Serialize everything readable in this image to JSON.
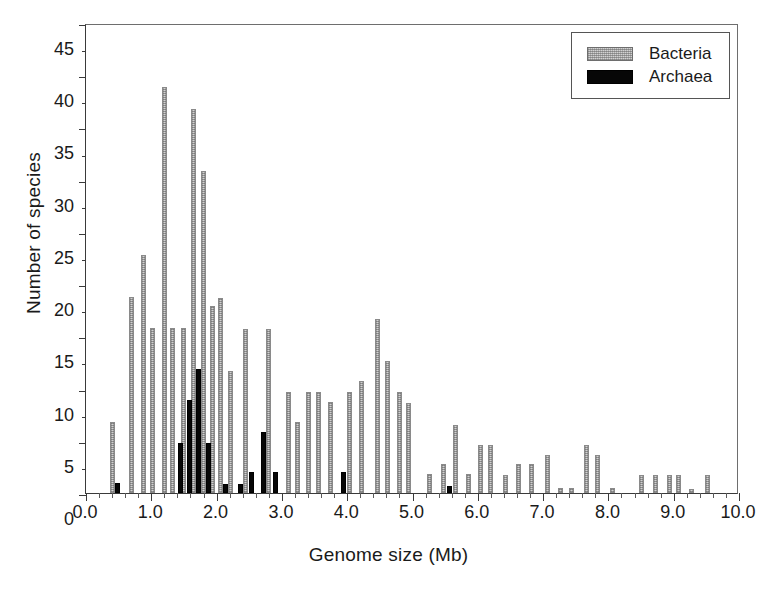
{
  "figure": {
    "background": "#ffffff",
    "caption_fragment": ""
  },
  "legend": {
    "position": "top-right",
    "entries": [
      {
        "label": "Bacteria",
        "color": "#d2d2d2",
        "pattern": "stippled-gray"
      },
      {
        "label": "Archaea",
        "color": "#070707",
        "pattern": "solid-black"
      }
    ]
  },
  "chart_data": {
    "type": "bar",
    "title": "",
    "subtitle": "",
    "xlabel": "Genome size (Mb)",
    "ylabel": "Number of species",
    "xlim": [
      0.0,
      10.0
    ],
    "ylim": [
      0,
      45
    ],
    "xticks": [
      0.0,
      1.0,
      2.0,
      3.0,
      4.0,
      5.0,
      6.0,
      7.0,
      8.0,
      9.0,
      10.0
    ],
    "xtick_labels": [
      "0.0",
      "1.0",
      "2.0",
      "3.0",
      "4.0",
      "5.0",
      "6.0",
      "7.0",
      "8.0",
      "9.0",
      "10.0"
    ],
    "xtick_minor_step": 0.2,
    "yticks": [
      0,
      5,
      10,
      15,
      20,
      25,
      30,
      35,
      40,
      45
    ],
    "ytick_labels": [
      "0",
      "5",
      "10",
      "15",
      "20",
      "25",
      "30",
      "35",
      "40",
      "45"
    ],
    "ytick_minor_step": 2.5,
    "grid": false,
    "bin_width": 0.1,
    "legend_position": "upper right",
    "x": [
      0.4,
      0.5,
      0.7,
      0.9,
      1.0,
      1.2,
      1.3,
      1.4,
      1.5,
      1.6,
      1.7,
      1.8,
      1.9,
      2.0,
      2.1,
      2.2,
      2.3,
      2.4,
      2.5,
      2.6,
      2.7,
      2.8,
      2.9,
      3.0,
      3.1,
      3.2,
      3.3,
      3.4,
      3.5,
      3.6,
      3.7,
      3.8,
      3.9,
      4.0,
      4.1,
      4.2,
      4.3,
      4.4,
      4.5,
      4.6,
      4.7,
      4.8,
      4.9,
      5.0,
      5.1,
      5.2,
      5.4,
      5.5,
      5.6,
      5.7,
      5.8,
      6.0,
      6.1,
      6.3,
      6.5,
      6.6,
      6.8,
      6.9,
      7.1,
      7.2,
      7.4,
      7.5,
      7.7,
      7.8,
      8.0,
      8.1,
      8.5,
      8.7,
      8.9,
      9.0,
      9.2,
      9.4,
      9.5
    ],
    "series": [
      {
        "name": "Bacteria",
        "color": "#d2d2d2",
        "values": [
          6.8,
          0,
          18.8,
          22.8,
          15.8,
          38.9,
          0,
          15.8,
          0,
          36.8,
          0,
          30.8,
          17.9,
          18.7,
          0,
          11.7,
          15.7,
          0,
          0,
          15.7,
          0,
          9.7,
          6.8,
          9.7,
          0,
          9.7,
          8.7,
          0,
          9.7,
          0,
          10.7,
          16.7,
          12.6,
          9.7,
          8.6,
          0,
          1.8,
          2.8,
          0,
          6.5,
          1.8,
          0,
          4.6,
          4.6,
          0,
          1.7,
          2.8,
          2.8,
          0,
          3.6,
          0,
          0.5,
          0.5,
          4.6,
          3.6,
          0.5,
          0,
          0,
          0.4,
          0,
          1.7,
          1.7,
          0.4,
          1.7,
          0,
          0,
          0,
          0,
          0,
          0,
          0,
          0,
          0
        ]
      },
      {
        "name": "Archaea",
        "color": "#070707",
        "values": [
          0,
          1.0,
          0,
          0,
          0,
          0,
          0,
          4.8,
          8.9,
          11.9,
          4.8,
          0.9,
          0,
          0.9,
          2.0,
          5.8,
          2.0,
          0,
          0,
          0,
          0,
          0,
          0,
          0,
          0,
          0,
          0,
          0,
          0,
          2.0,
          0,
          0,
          0,
          0,
          0,
          0,
          0,
          0,
          0,
          0,
          0,
          0,
          0,
          0,
          0,
          0,
          0,
          0.7,
          0,
          0,
          0,
          0,
          0,
          0,
          0,
          0,
          0,
          0,
          0,
          0,
          0,
          0,
          0,
          0,
          0,
          0,
          0,
          0,
          0,
          0,
          0,
          0,
          0
        ]
      }
    ],
    "bars": [
      {
        "x": 0.4,
        "value": 6.8,
        "series": "Bacteria"
      },
      {
        "x": 0.48,
        "value": 1.0,
        "series": "Archaea"
      },
      {
        "x": 0.7,
        "value": 18.8,
        "series": "Bacteria"
      },
      {
        "x": 0.88,
        "value": 22.8,
        "series": "Bacteria"
      },
      {
        "x": 1.02,
        "value": 15.8,
        "series": "Bacteria"
      },
      {
        "x": 1.2,
        "value": 38.9,
        "series": "Bacteria"
      },
      {
        "x": 1.32,
        "value": 15.8,
        "series": "Bacteria"
      },
      {
        "x": 1.44,
        "value": 4.8,
        "series": "Archaea"
      },
      {
        "x": 1.5,
        "value": 15.8,
        "series": "Bacteria"
      },
      {
        "x": 1.58,
        "value": 8.9,
        "series": "Archaea"
      },
      {
        "x": 1.64,
        "value": 36.8,
        "series": "Bacteria"
      },
      {
        "x": 1.72,
        "value": 11.9,
        "series": "Archaea"
      },
      {
        "x": 1.8,
        "value": 30.8,
        "series": "Bacteria"
      },
      {
        "x": 1.88,
        "value": 4.8,
        "series": "Archaea"
      },
      {
        "x": 1.94,
        "value": 17.9,
        "series": "Bacteria"
      },
      {
        "x": 2.06,
        "value": 18.7,
        "series": "Bacteria"
      },
      {
        "x": 2.14,
        "value": 0.9,
        "series": "Archaea"
      },
      {
        "x": 2.22,
        "value": 11.7,
        "series": "Bacteria"
      },
      {
        "x": 2.36,
        "value": 0.9,
        "series": "Archaea"
      },
      {
        "x": 2.44,
        "value": 15.7,
        "series": "Bacteria"
      },
      {
        "x": 2.54,
        "value": 2.0,
        "series": "Archaea"
      },
      {
        "x": 2.72,
        "value": 5.8,
        "series": "Archaea"
      },
      {
        "x": 2.8,
        "value": 15.7,
        "series": "Bacteria"
      },
      {
        "x": 2.9,
        "value": 2.0,
        "series": "Archaea"
      },
      {
        "x": 3.1,
        "value": 9.7,
        "series": "Bacteria"
      },
      {
        "x": 3.24,
        "value": 6.8,
        "series": "Bacteria"
      },
      {
        "x": 3.4,
        "value": 9.7,
        "series": "Bacteria"
      },
      {
        "x": 3.56,
        "value": 9.7,
        "series": "Bacteria"
      },
      {
        "x": 3.74,
        "value": 8.7,
        "series": "Bacteria"
      },
      {
        "x": 3.94,
        "value": 2.0,
        "series": "Archaea"
      },
      {
        "x": 4.04,
        "value": 9.7,
        "series": "Bacteria"
      },
      {
        "x": 4.22,
        "value": 10.7,
        "series": "Bacteria"
      },
      {
        "x": 4.46,
        "value": 16.7,
        "series": "Bacteria"
      },
      {
        "x": 4.62,
        "value": 12.6,
        "series": "Bacteria"
      },
      {
        "x": 4.8,
        "value": 9.7,
        "series": "Bacteria"
      },
      {
        "x": 4.94,
        "value": 8.6,
        "series": "Bacteria"
      },
      {
        "x": 5.26,
        "value": 1.8,
        "series": "Bacteria"
      },
      {
        "x": 5.48,
        "value": 2.8,
        "series": "Bacteria"
      },
      {
        "x": 5.56,
        "value": 0.7,
        "series": "Archaea"
      },
      {
        "x": 5.66,
        "value": 6.5,
        "series": "Bacteria"
      },
      {
        "x": 5.86,
        "value": 1.8,
        "series": "Bacteria"
      },
      {
        "x": 6.04,
        "value": 4.6,
        "series": "Bacteria"
      },
      {
        "x": 6.2,
        "value": 4.6,
        "series": "Bacteria"
      },
      {
        "x": 6.42,
        "value": 1.7,
        "series": "Bacteria"
      },
      {
        "x": 6.62,
        "value": 2.8,
        "series": "Bacteria"
      },
      {
        "x": 6.82,
        "value": 2.8,
        "series": "Bacteria"
      },
      {
        "x": 7.06,
        "value": 3.6,
        "series": "Bacteria"
      },
      {
        "x": 7.26,
        "value": 0.5,
        "series": "Bacteria"
      },
      {
        "x": 7.44,
        "value": 0.5,
        "series": "Bacteria"
      },
      {
        "x": 7.66,
        "value": 4.6,
        "series": "Bacteria"
      },
      {
        "x": 7.84,
        "value": 3.6,
        "series": "Bacteria"
      },
      {
        "x": 8.06,
        "value": 0.5,
        "series": "Bacteria"
      },
      {
        "x": 8.5,
        "value": 1.7,
        "series": "Bacteria"
      },
      {
        "x": 8.72,
        "value": 1.7,
        "series": "Bacteria"
      },
      {
        "x": 8.94,
        "value": 1.7,
        "series": "Bacteria"
      },
      {
        "x": 9.08,
        "value": 1.7,
        "series": "Bacteria"
      },
      {
        "x": 9.28,
        "value": 0.4,
        "series": "Bacteria"
      },
      {
        "x": 9.52,
        "value": 1.7,
        "series": "Bacteria"
      }
    ]
  }
}
